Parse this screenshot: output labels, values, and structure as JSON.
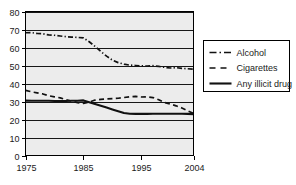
{
  "chart_data": {
    "type": "line",
    "title": "",
    "xlabel": "",
    "ylabel": "",
    "xlim": [
      1975,
      2004
    ],
    "ylim": [
      0,
      80
    ],
    "grid": true,
    "legend_position": "right",
    "y_ticks": [
      "0",
      "10",
      "20",
      "30",
      "40",
      "50",
      "60",
      "70",
      "80"
    ],
    "y_tick_values": [
      0,
      10,
      20,
      30,
      40,
      50,
      60,
      70,
      80
    ],
    "x_ticks": [
      "1975",
      "1985",
      "1995",
      "2004"
    ],
    "x_tick_values": [
      1975,
      1985,
      1995,
      2004
    ],
    "x": [
      1975,
      1976,
      1977,
      1978,
      1979,
      1980,
      1981,
      1982,
      1983,
      1984,
      1985,
      1986,
      1987,
      1988,
      1989,
      1990,
      1991,
      1992,
      1993,
      1994,
      1995,
      1996,
      1997,
      1998,
      1999,
      2000,
      2001,
      2002,
      2003,
      2004
    ],
    "series": [
      {
        "name": "Alcohol",
        "style": "dash-dot",
        "color": "#111111",
        "values": [
          68.2,
          68.3,
          67.8,
          67.6,
          67.0,
          66.8,
          66.4,
          66.0,
          65.8,
          65.6,
          65.3,
          63.2,
          60.6,
          57.8,
          55.2,
          53.0,
          51.6,
          50.8,
          50.2,
          50.0,
          49.8,
          49.6,
          49.9,
          49.5,
          49.0,
          48.6,
          48.8,
          48.4,
          48.2,
          48.0
        ]
      },
      {
        "name": "Cigarettes",
        "style": "dashed",
        "color": "#111111",
        "values": [
          36.2,
          35.4,
          34.8,
          34.2,
          33.2,
          32.6,
          32.0,
          31.0,
          30.2,
          29.4,
          29.0,
          29.6,
          30.8,
          31.2,
          31.4,
          31.6,
          31.8,
          32.2,
          32.6,
          32.8,
          32.5,
          32.6,
          32.2,
          31.0,
          29.4,
          28.6,
          27.6,
          26.4,
          24.8,
          23.4
        ]
      },
      {
        "name": "Any illicit drug",
        "style": "solid",
        "color": "#111111",
        "values": [
          30.5,
          30.4,
          30.4,
          30.4,
          30.4,
          30.3,
          30.3,
          30.3,
          30.4,
          30.4,
          30.6,
          29.6,
          28.6,
          27.6,
          26.6,
          25.6,
          24.6,
          23.6,
          23.2,
          23.1,
          23.1,
          23.1,
          23.2,
          23.2,
          23.2,
          23.2,
          23.2,
          23.2,
          23.1,
          23.0
        ]
      }
    ],
    "legend": [
      {
        "label": "Alcohol",
        "style": "dash-dot"
      },
      {
        "label": "Cigarettes",
        "style": "dashed"
      },
      {
        "label": "Any illicit drug",
        "style": "solid"
      }
    ]
  },
  "colors": {
    "plot_background": "#ececec",
    "axis": "#000000",
    "series": "#111111",
    "page_background": "#ffffff"
  }
}
